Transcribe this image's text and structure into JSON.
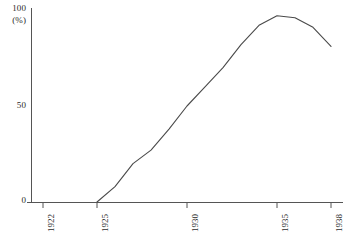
{
  "chart_data": {
    "type": "line",
    "title": "",
    "subtitle": "",
    "xlabel": "",
    "ylabel": "",
    "unit_label": "(%)",
    "x": [
      1925,
      1926,
      1927,
      1928,
      1929,
      1930,
      1931,
      1932,
      1933,
      1934,
      1935,
      1936,
      1937,
      1938
    ],
    "values": [
      0,
      8,
      20,
      27,
      38,
      50,
      60,
      70,
      82,
      92,
      97,
      96,
      91,
      81
    ],
    "series": [
      {
        "name": "",
        "values": [
          0,
          8,
          20,
          27,
          38,
          50,
          60,
          70,
          82,
          92,
          97,
          96,
          91,
          81
        ]
      }
    ],
    "xlim": [
      1921.2,
      1938.6
    ],
    "ylim": [
      0,
      100
    ],
    "grid": false,
    "legend": false,
    "legend_position": "none",
    "line_color": "#4a4a4a",
    "axis_color": "#555555",
    "background_color": "#ffffff"
  },
  "axes": {
    "y": {
      "ticks": [
        {
          "value": 100,
          "label": "100"
        },
        {
          "value": 50,
          "label": "50"
        },
        {
          "value": 0,
          "label": "0"
        }
      ],
      "unit": "(%)"
    },
    "x": {
      "ticks": [
        {
          "value": 1922,
          "label": "1922"
        },
        {
          "value": 1925,
          "label": "1925"
        },
        {
          "value": 1930,
          "label": "1930"
        },
        {
          "value": 1935,
          "label": "1935"
        },
        {
          "value": 1938,
          "label": "1938"
        }
      ]
    }
  }
}
